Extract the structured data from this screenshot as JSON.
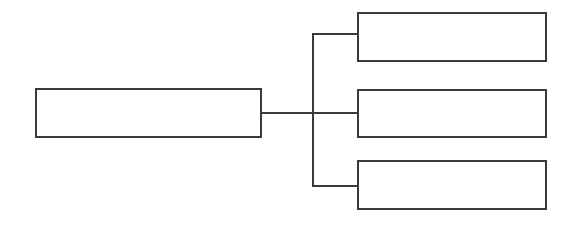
{
  "diagram": {
    "type": "tree",
    "stroke_color": "#3a3a3a",
    "root": {
      "label": ""
    },
    "children": [
      {
        "label": ""
      },
      {
        "label": ""
      },
      {
        "label": ""
      }
    ]
  }
}
